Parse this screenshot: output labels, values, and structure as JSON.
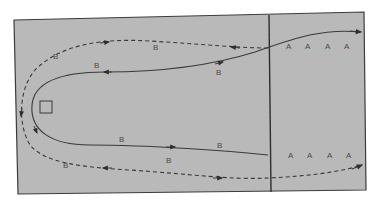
{
  "diagram": {
    "type": "play-diagram",
    "field": {
      "fill": "#b9b9b9",
      "border": "#3c3c3c"
    },
    "divider": {
      "x": 270
    },
    "marker_square": {
      "x": 40,
      "y": 101,
      "size": 12
    },
    "team_a_top": [
      {
        "label": "A",
        "x": 286,
        "y": 49
      },
      {
        "label": "A",
        "x": 305,
        "y": 49
      },
      {
        "label": "A",
        "x": 325,
        "y": 49
      },
      {
        "label": "A",
        "x": 344,
        "y": 49
      }
    ],
    "team_a_bottom": [
      {
        "label": "A",
        "x": 288,
        "y": 158
      },
      {
        "label": "A",
        "x": 307,
        "y": 158
      },
      {
        "label": "A",
        "x": 327,
        "y": 158
      },
      {
        "label": "A",
        "x": 346,
        "y": 158
      }
    ],
    "team_b": [
      {
        "label": "B",
        "x": 55,
        "y": 59,
        "path": "dashed-upper"
      },
      {
        "label": "B",
        "x": 155,
        "y": 50,
        "path": "dashed-upper"
      },
      {
        "label": "B",
        "x": 96,
        "y": 68,
        "path": "solid-upper"
      },
      {
        "label": "B",
        "x": 218,
        "y": 75,
        "path": "solid-upper"
      },
      {
        "label": "B",
        "x": 121,
        "y": 142,
        "path": "solid-lower"
      },
      {
        "label": "B",
        "x": 219,
        "y": 148,
        "path": "solid-lower"
      },
      {
        "label": "B",
        "x": 65,
        "y": 168,
        "path": "dashed-lower"
      },
      {
        "label": "B",
        "x": 168,
        "y": 163,
        "path": "dashed-lower"
      }
    ],
    "paths": {
      "solid": {
        "style": "solid",
        "color": "#3a3a3a"
      },
      "dashed": {
        "style": "dashed",
        "color": "#3a3a3a"
      }
    }
  }
}
